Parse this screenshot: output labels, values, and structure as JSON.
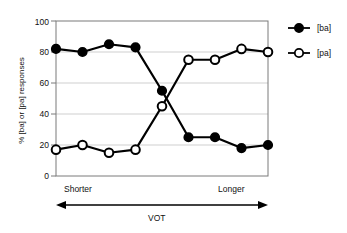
{
  "chart_data": {
    "type": "line",
    "title": "",
    "subtitle": "",
    "xlabel": "VOT",
    "ylabel": "% [ba] or [pa] responses",
    "ylim": [
      0,
      100
    ],
    "yticks": [
      0,
      20,
      40,
      60,
      80,
      100
    ],
    "ytick_labels": [
      "0",
      "20",
      "40",
      "60",
      "80",
      "100"
    ],
    "xlim": [
      1,
      9
    ],
    "x": [
      1,
      2,
      3,
      4,
      5,
      6,
      7,
      8,
      9
    ],
    "xtick_labels": [],
    "x_axis_low_label": "Shorter",
    "x_axis_high_label": "Longer",
    "grid": "horizontal",
    "legend_position": "right",
    "series": [
      {
        "name": "[ba]",
        "marker": "filled-circle",
        "color": "#000000",
        "values": [
          82,
          80,
          85,
          83,
          55,
          25,
          25,
          18,
          20
        ]
      },
      {
        "name": "[pa]",
        "marker": "open-circle",
        "color": "#000000",
        "values": [
          17,
          20,
          15,
          17,
          45,
          75,
          75,
          82,
          80
        ]
      }
    ]
  },
  "legend": {
    "entries": [
      {
        "label": "[ba]",
        "marker": "filled-circle"
      },
      {
        "label": "[pa]",
        "marker": "open-circle"
      }
    ]
  },
  "axis": {
    "y_title": "% [ba] or [pa] responses",
    "x_title": "VOT",
    "x_left_label": "Shorter",
    "x_right_label": "Longer",
    "ytick_labels": [
      "100",
      "80",
      "60",
      "40",
      "20",
      "0"
    ]
  },
  "colors": {
    "line": "#000000",
    "frame": "#7a7a7a",
    "grid": "#cfcfcf",
    "background": "#ffffff"
  }
}
